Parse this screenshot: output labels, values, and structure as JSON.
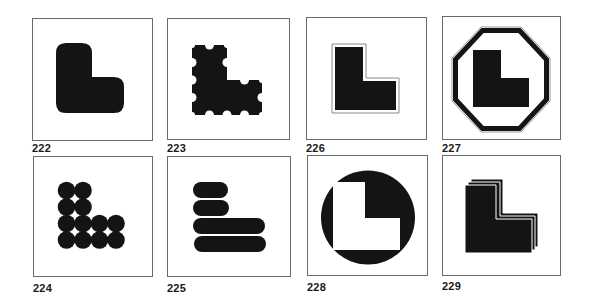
{
  "figures": [
    {
      "id": "222",
      "label": "222",
      "description": "L-shape with rounded corners"
    },
    {
      "id": "223",
      "label": "223",
      "description": "L-shape with semicircular scalloped notches"
    },
    {
      "id": "226",
      "label": "226",
      "description": "L-shape with thin outline inset"
    },
    {
      "id": "227",
      "label": "227",
      "description": "L-shape inside an octagon border"
    },
    {
      "id": "224",
      "label": "224",
      "description": "L-shape built from overlapping circles"
    },
    {
      "id": "225",
      "label": "225",
      "description": "L-shape built from stacked pill bars"
    },
    {
      "id": "228",
      "label": "228",
      "description": "White L-shape knocked out of a black circle"
    },
    {
      "id": "229",
      "label": "229",
      "description": "Triple layered offset L-shapes"
    }
  ],
  "colors": {
    "ink": "#141414",
    "frame": "#6a6a6a",
    "paper": "#ffffff",
    "outline_gray": "#9a9a9a"
  }
}
